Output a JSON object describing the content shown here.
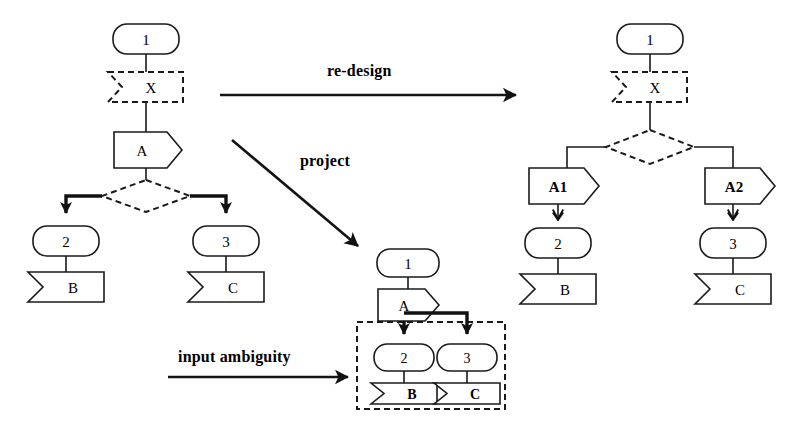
{
  "figure": {
    "background_color": "#ffffff",
    "stroke_color": "#1a1a1a",
    "width": 805,
    "height": 445
  },
  "edge_labels": {
    "redesign": "re-design",
    "project": "project",
    "input_ambiguity": "input ambiguity"
  },
  "diagrams": {
    "original": {
      "name": "original-design",
      "nodes": {
        "state1": "1",
        "x": "X",
        "a": "A",
        "state2": "2",
        "state3": "3",
        "b": "B",
        "c": "C"
      }
    },
    "projected": {
      "name": "projected-design",
      "nodes": {
        "state1": "1",
        "a": "A",
        "state2": "2",
        "state3": "3",
        "b": "B",
        "c": "C"
      }
    },
    "redesigned": {
      "name": "redesigned-design",
      "nodes": {
        "state1": "1",
        "x": "X",
        "a1": "A1",
        "a2": "A2",
        "state2": "2",
        "state3": "3",
        "b": "B",
        "c": "C"
      }
    }
  }
}
